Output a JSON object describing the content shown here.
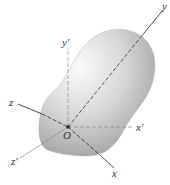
{
  "diagram": {
    "origin_label": "O",
    "axes": {
      "principal": [
        {
          "label": "x",
          "style": "dashed-to-solid"
        },
        {
          "label": "y",
          "style": "dashed-to-solid"
        },
        {
          "label": "z",
          "style": "solid-to-dashed"
        }
      ],
      "reference": [
        {
          "label": "x'",
          "style": "thin"
        },
        {
          "label": "y'",
          "style": "thin"
        },
        {
          "label": "z'",
          "style": "thin"
        }
      ]
    },
    "colors": {
      "body_light": "#f4f4f4",
      "body_dark": "#9a9a9a",
      "axis_dark": "#333333",
      "axis_light": "#888888"
    }
  }
}
